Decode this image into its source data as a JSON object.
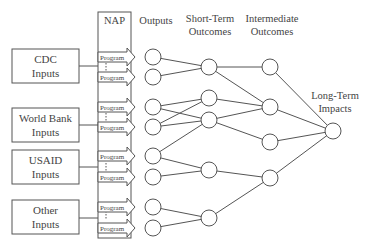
{
  "headers": {
    "nap": "NAP",
    "outputs": "Outputs",
    "short_term": [
      "Short-Term",
      "Outcomes"
    ],
    "intermediate": [
      "Intermediate",
      "Outcomes"
    ],
    "long_term": [
      "Long-Term",
      "Impacts"
    ]
  },
  "inputs": [
    {
      "line1": "CDC",
      "line2": "Inputs"
    },
    {
      "line1": "World Bank",
      "line2": "Inputs"
    },
    {
      "line1": "USAID",
      "line2": "Inputs"
    },
    {
      "line1": "Other",
      "line2": "Inputs"
    }
  ],
  "program_label": "Program",
  "programs": [
    "Program",
    "Program",
    "Program",
    "Program",
    "Program",
    "Program",
    "Program",
    "Program"
  ],
  "colors": {
    "stroke": "#555555",
    "text": "#444444",
    "background": "#ffffff"
  }
}
